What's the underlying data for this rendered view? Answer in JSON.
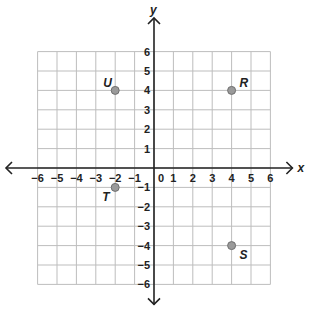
{
  "chart_data": {
    "type": "scatter",
    "title": "",
    "xlabel": "x",
    "ylabel": "y",
    "xlim": [
      -6,
      6
    ],
    "ylim": [
      -6,
      6
    ],
    "grid": true,
    "x_ticks": [
      -6,
      -5,
      -4,
      -3,
      -2,
      -1,
      0,
      1,
      2,
      3,
      4,
      5,
      6
    ],
    "y_ticks": [
      -6,
      -5,
      -4,
      -3,
      -2,
      -1,
      1,
      2,
      3,
      4,
      5,
      6
    ],
    "points": [
      {
        "label": "U",
        "x": -2,
        "y": 4
      },
      {
        "label": "R",
        "x": 4,
        "y": 4
      },
      {
        "label": "T",
        "x": -2,
        "y": -1
      },
      {
        "label": "S",
        "x": 4,
        "y": -4
      }
    ]
  },
  "colors": {
    "grid": "#bdbdbd",
    "axis": "#222222",
    "point_fill": "#9a9a9a",
    "point_stroke": "#6f6f6f"
  }
}
